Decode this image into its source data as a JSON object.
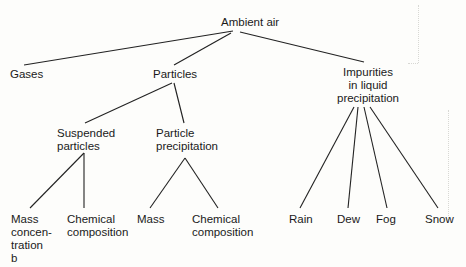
{
  "diagram": {
    "root": "Ambient air",
    "level1": {
      "gases": "Gases",
      "particles": "Particles",
      "impurities": [
        "Impurities",
        "in liquid",
        "precipitation"
      ]
    },
    "level2": {
      "suspended": [
        "Suspended",
        "particles"
      ],
      "precipitation": [
        "Particle",
        "precipitation"
      ]
    },
    "level3": {
      "mass_concentration": [
        "Mass",
        "concen-",
        "tration"
      ],
      "chemical_composition_1": [
        "Chemical",
        "composition"
      ],
      "mass": "Mass",
      "chemical_composition_2": [
        "Chemical",
        "composition"
      ],
      "rain": "Rain",
      "dew": "Dew",
      "fog": "Fog",
      "snow": "Snow"
    },
    "panel_label": "b"
  }
}
